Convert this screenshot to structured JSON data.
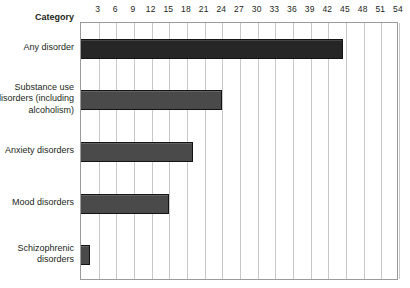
{
  "header": {
    "category_label": "Category"
  },
  "chart_data": {
    "type": "bar",
    "orientation": "horizontal",
    "title": "",
    "xlabel": "",
    "ylabel": "Category",
    "xlim": [
      0,
      54
    ],
    "xticks": [
      3,
      6,
      9,
      12,
      15,
      18,
      21,
      24,
      27,
      30,
      33,
      36,
      39,
      42,
      45,
      48,
      51,
      54
    ],
    "grid": true,
    "legend": "none",
    "categories": [
      "Any disorder",
      "Substance use\ndisorders (including\nalcoholism)",
      "Anxiety disorders",
      "Mood disorders",
      "Schizophrenic\ndisorders"
    ],
    "values": [
      44.5,
      24,
      19,
      15,
      1.5
    ],
    "colors": [
      "#262626",
      "#4a4a4a",
      "#4a4a4a",
      "#4a4a4a",
      "#4a4a4a"
    ]
  },
  "style": {
    "grid_color": "#c8c8c8",
    "frame_color": "#9a9a9a",
    "bar_outline": "#141414",
    "text_color": "#231f20"
  }
}
